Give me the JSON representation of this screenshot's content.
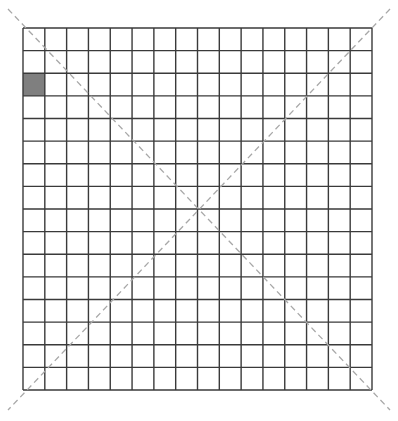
{
  "grid": {
    "rows": 16,
    "cols": 16,
    "x": 23,
    "y": 28,
    "width": 349,
    "height": 362,
    "line_color": "#3a3a3a",
    "line_width": 1.4,
    "filled_cells": [
      {
        "row": 2,
        "col": 0,
        "color": "#7f7f7f"
      }
    ]
  },
  "diagonals": {
    "color": "#a8a8a8",
    "width": 1.3,
    "dash": "6,4",
    "lines": [
      {
        "x1": 8,
        "y1": 9,
        "x2": 390,
        "y2": 410
      },
      {
        "x1": 390,
        "y1": 9,
        "x2": 8,
        "y2": 410
      }
    ]
  }
}
